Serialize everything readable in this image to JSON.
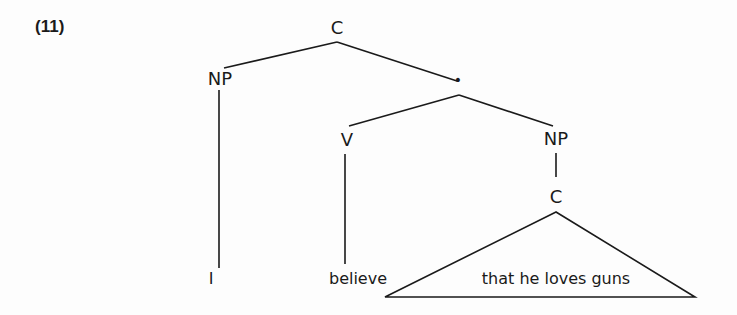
{
  "example_number": "(11)",
  "tree": {
    "root": {
      "label": "C"
    },
    "subject": {
      "label": "NP",
      "leaf": "I"
    },
    "intermediate": {
      "label": "•"
    },
    "verb": {
      "label": "V",
      "leaf": "believe"
    },
    "object": {
      "label": "NP",
      "child": {
        "label": "C",
        "triangle_text": "that he loves guns"
      }
    }
  },
  "colors": {
    "ink": "#1a1a1a",
    "background": "#fdfdfd"
  }
}
